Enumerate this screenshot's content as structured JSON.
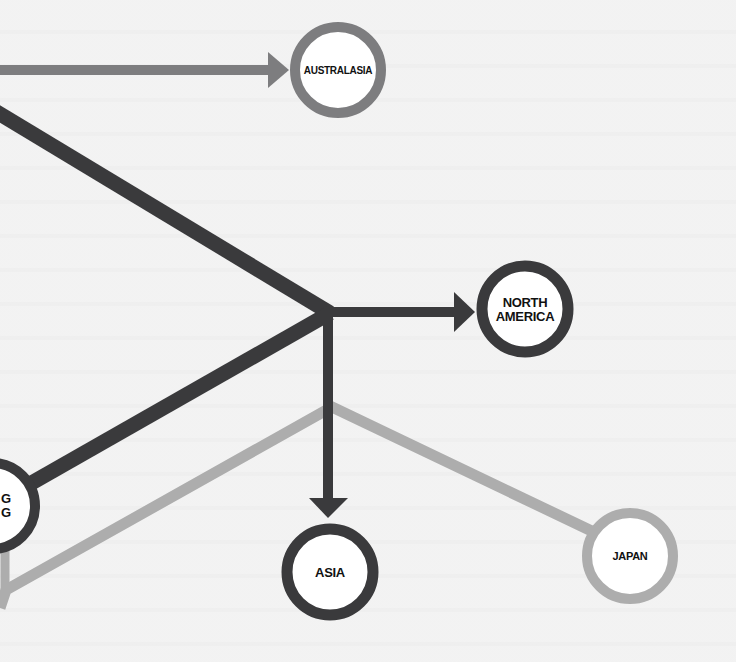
{
  "colors": {
    "background": "#f1f1f1",
    "dark_line": "#3a3a3c",
    "medium_line": "#7d7d7f",
    "light_line": "#adadad",
    "node_fill": "#ffffff",
    "label_text": "#111111"
  },
  "nodes": {
    "origin": {
      "label_line1": "G",
      "label_line2": "G",
      "note": "partially cut off at left edge"
    },
    "australasia": {
      "label": "AUSTRALASIA"
    },
    "north_america": {
      "label_line1": "NORTH",
      "label_line2": "AMERICA"
    },
    "asia": {
      "label": "ASIA"
    },
    "japan": {
      "label": "JAPAN"
    }
  },
  "edges": [
    {
      "from": "off-screen-left",
      "to": "australasia",
      "style": "medium",
      "arrow": true
    },
    {
      "from": "off-screen-left",
      "to": "junction",
      "style": "dark-thick"
    },
    {
      "from": "origin",
      "to": "junction",
      "style": "dark-thick"
    },
    {
      "from": "junction",
      "to": "north_america",
      "style": "dark",
      "arrow": true
    },
    {
      "from": "junction",
      "to": "asia",
      "style": "dark",
      "arrow": true
    },
    {
      "from": "origin",
      "to": "japan",
      "style": "light",
      "via": "apex"
    }
  ]
}
